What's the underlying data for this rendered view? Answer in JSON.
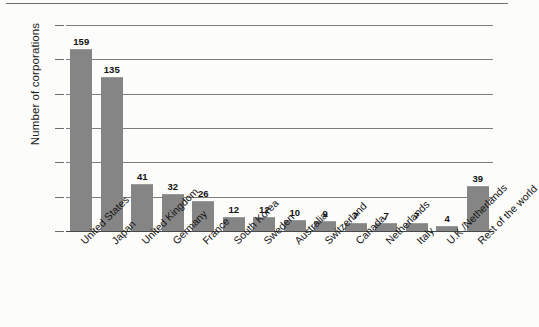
{
  "chart_data": {
    "type": "bar",
    "title": "",
    "subtitle": "",
    "xlabel": "",
    "ylabel": "Number of corporations",
    "ylim": [
      0,
      180
    ],
    "yticks": [
      0,
      30,
      60,
      90,
      120,
      150,
      180
    ],
    "grid": true,
    "legend": null,
    "orientation": "vertical",
    "bar_color": "#858585",
    "categories": [
      "United States",
      "Japan",
      "United Kingdom",
      "Germany",
      "France",
      "South Korea",
      "Sweden",
      "Australia",
      "Switzerland",
      "Canada",
      "Netherlands",
      "Italy",
      "U.K./Netherlands",
      "Rest of the world"
    ],
    "values": [
      159,
      135,
      41,
      32,
      26,
      12,
      12,
      10,
      9,
      7,
      7,
      7,
      4,
      39
    ],
    "value_labels": [
      "159",
      "135",
      "41",
      "32",
      "26",
      "12",
      "12",
      "10",
      "9",
      "7",
      "7",
      "7",
      "4",
      "39"
    ]
  },
  "axis": {
    "y_title": "Number of corporations",
    "y_tick_labels": [
      "180",
      "150",
      "120",
      "90",
      "60",
      "30",
      "0"
    ]
  },
  "colors": {
    "bar": "#858585",
    "gridline": "#7d7d7d",
    "baseline": "#4a4a4a",
    "text": "#141414",
    "background": "#fcfcfb"
  }
}
